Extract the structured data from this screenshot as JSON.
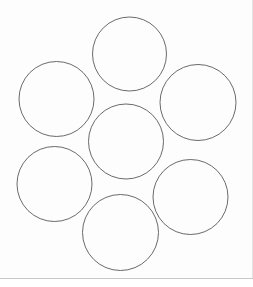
{
  "canvas": {
    "width": 253,
    "height": 287,
    "background_color": "#fdfdfd",
    "title": "Circle Packing Diagram"
  },
  "style": {
    "circle_stroke_color": "#595959",
    "circle_stroke_width": 0.9,
    "circle_fill": "none",
    "divider_color": "#c9c9c9",
    "edge_line_color": "#e3e3e3",
    "footer_background": "#ffffff"
  },
  "figure": {
    "kind": "hexagonal-circle-packing",
    "arrangement": "six-around-one",
    "circle_count": 7,
    "circles": [
      {
        "id": "circle-top",
        "label": "top",
        "cx": 129.5,
        "cy": 54.0,
        "r": 37.0
      },
      {
        "id": "circle-upper-left",
        "label": "upper-left",
        "cx": 56.5,
        "cy": 99.0,
        "r": 37.5
      },
      {
        "id": "circle-upper-right",
        "label": "upper-right",
        "cx": 198.0,
        "cy": 102.5,
        "r": 38.0
      },
      {
        "id": "circle-center",
        "label": "center",
        "cx": 126.0,
        "cy": 141.5,
        "r": 37.5
      },
      {
        "id": "circle-lower-left",
        "label": "lower-left",
        "cx": 54.5,
        "cy": 184.0,
        "r": 37.5
      },
      {
        "id": "circle-lower-right",
        "label": "lower-right",
        "cx": 190.5,
        "cy": 197.0,
        "r": 37.5
      },
      {
        "id": "circle-bottom",
        "label": "bottom",
        "cx": 120.5,
        "cy": 232.5,
        "r": 38.0
      }
    ],
    "divider": {
      "id": "bottom-divider",
      "x1": 0,
      "y1": 278.5,
      "x2": 253,
      "y2": 278.5
    },
    "right_edge": {
      "id": "right-edge-line",
      "x1": 252.5,
      "y1": 0,
      "x2": 252.5,
      "y2": 278
    },
    "footer": {
      "y": 279,
      "height": 8
    }
  },
  "chart_data": {
    "type": "scatter",
    "xlabel": "",
    "ylabel": "",
    "xlim": [
      0,
      253
    ],
    "ylim": [
      287,
      0
    ],
    "grid": false,
    "legend": null,
    "annotations": [],
    "categories": [
      "top",
      "upper-left",
      "upper-right",
      "center",
      "lower-left",
      "lower-right",
      "bottom"
    ],
    "series": [
      {
        "name": "circle centers",
        "marker": "open-circle",
        "x": [
          129.5,
          56.5,
          198.0,
          126.0,
          54.5,
          190.5,
          120.5
        ],
        "y": [
          54.0,
          99.0,
          102.5,
          141.5,
          184.0,
          197.0,
          232.5
        ],
        "radii": [
          37.0,
          37.5,
          38.0,
          37.5,
          37.5,
          37.5,
          38.0
        ]
      }
    ]
  }
}
